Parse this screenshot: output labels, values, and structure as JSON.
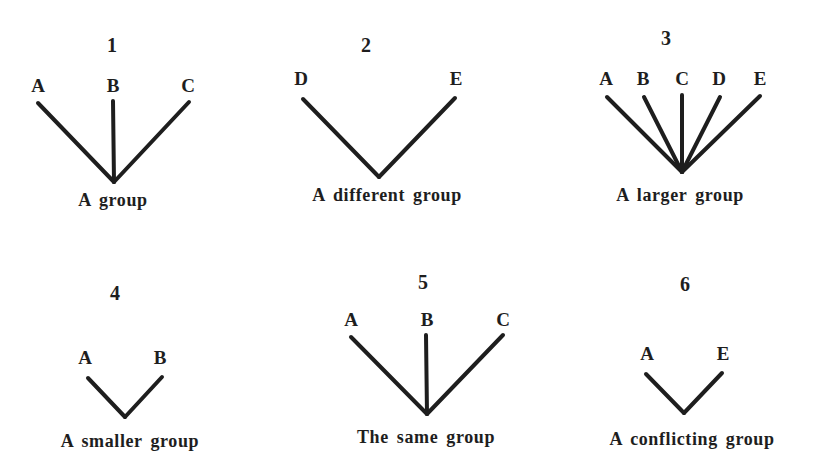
{
  "diagrams": [
    {
      "number": "1",
      "caption": "A group",
      "nodes": [
        "A",
        "B",
        "C"
      ],
      "numPos": [
        112,
        52
      ],
      "capPos": [
        113,
        206
      ],
      "apex": [
        114,
        182
      ],
      "members": [
        {
          "label": "A",
          "labelPos": [
            38,
            92
          ],
          "from": [
            38,
            103
          ]
        },
        {
          "label": "B",
          "labelPos": [
            113,
            92
          ],
          "from": [
            113,
            101
          ]
        },
        {
          "label": "C",
          "labelPos": [
            188,
            92
          ],
          "from": [
            189,
            102
          ]
        }
      ]
    },
    {
      "number": "2",
      "caption": "A different group",
      "nodes": [
        "D",
        "E"
      ],
      "numPos": [
        366,
        52
      ],
      "capPos": [
        387,
        201
      ],
      "apex": [
        379,
        177
      ],
      "members": [
        {
          "label": "D",
          "labelPos": [
            301,
            85
          ],
          "from": [
            303,
            99
          ]
        },
        {
          "label": "E",
          "labelPos": [
            456,
            85
          ],
          "from": [
            455,
            98
          ]
        }
      ]
    },
    {
      "number": "3",
      "caption": "A larger group",
      "nodes": [
        "A",
        "B",
        "C",
        "D",
        "E"
      ],
      "numPos": [
        666,
        45
      ],
      "capPos": [
        680,
        201
      ],
      "apex": [
        682,
        172
      ],
      "members": [
        {
          "label": "A",
          "labelPos": [
            606,
            85
          ],
          "from": [
            607,
            97
          ]
        },
        {
          "label": "B",
          "labelPos": [
            643,
            85
          ],
          "from": [
            644,
            97
          ]
        },
        {
          "label": "C",
          "labelPos": [
            682,
            85
          ],
          "from": [
            682,
            95
          ]
        },
        {
          "label": "D",
          "labelPos": [
            719,
            85
          ],
          "from": [
            720,
            97
          ]
        },
        {
          "label": "E",
          "labelPos": [
            760,
            85
          ],
          "from": [
            760,
            96
          ]
        }
      ]
    },
    {
      "number": "4",
      "caption": "A smaller group",
      "nodes": [
        "A",
        "B"
      ],
      "numPos": [
        115,
        300
      ],
      "capPos": [
        130,
        447
      ],
      "apex": [
        125,
        417
      ],
      "members": [
        {
          "label": "A",
          "labelPos": [
            85,
            364
          ],
          "from": [
            88,
            378
          ]
        },
        {
          "label": "B",
          "labelPos": [
            160,
            364
          ],
          "from": [
            162,
            377
          ]
        }
      ]
    },
    {
      "number": "5",
      "caption": "The same group",
      "nodes": [
        "A",
        "B",
        "C"
      ],
      "numPos": [
        423,
        289
      ],
      "capPos": [
        426,
        443
      ],
      "apex": [
        427,
        414
      ],
      "members": [
        {
          "label": "A",
          "labelPos": [
            351,
            326
          ],
          "from": [
            351,
            337
          ]
        },
        {
          "label": "B",
          "labelPos": [
            427,
            326
          ],
          "from": [
            426,
            335
          ]
        },
        {
          "label": "C",
          "labelPos": [
            503,
            326
          ],
          "from": [
            503,
            335
          ]
        }
      ]
    },
    {
      "number": "6",
      "caption": "A conflicting group",
      "nodes": [
        "A",
        "E"
      ],
      "numPos": [
        685,
        291
      ],
      "capPos": [
        692,
        445
      ],
      "apex": [
        684,
        413
      ],
      "members": [
        {
          "label": "A",
          "labelPos": [
            647,
            360
          ],
          "from": [
            646,
            374
          ]
        },
        {
          "label": "E",
          "labelPos": [
            723,
            360
          ],
          "from": [
            722,
            373
          ]
        }
      ]
    }
  ]
}
